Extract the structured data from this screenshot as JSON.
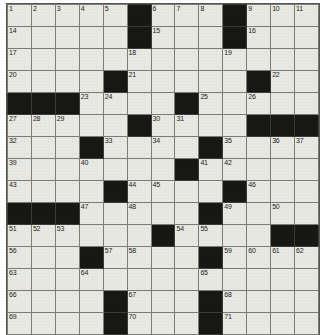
{
  "document": {
    "type": "crossword-puzzle-grid",
    "title": "Crossword Puzzle",
    "columns": 13,
    "rows": 15,
    "colors": {
      "cell_background": "#e9e9e4",
      "block_background": "#161614",
      "grid_line": "#7c7c74",
      "number_text": "#1a1a18",
      "page_background": "#ffffff"
    }
  },
  "grid": {
    "cells": [
      [
        {
          "block": false,
          "number": "1"
        },
        {
          "block": false,
          "number": "2"
        },
        {
          "block": false,
          "number": "3"
        },
        {
          "block": false,
          "number": "4"
        },
        {
          "block": false,
          "number": "5"
        },
        {
          "block": true,
          "number": ""
        },
        {
          "block": false,
          "number": "6"
        },
        {
          "block": false,
          "number": "7"
        },
        {
          "block": false,
          "number": "8"
        },
        {
          "block": true,
          "number": ""
        },
        {
          "block": false,
          "number": "9"
        },
        {
          "block": false,
          "number": "10"
        },
        {
          "block": false,
          "number": "11"
        },
        {
          "block": false,
          "number": "12"
        },
        {
          "block": false,
          "number": "13"
        }
      ],
      [
        {
          "block": false,
          "number": "14"
        },
        {
          "block": false,
          "number": ""
        },
        {
          "block": false,
          "number": ""
        },
        {
          "block": false,
          "number": ""
        },
        {
          "block": false,
          "number": ""
        },
        {
          "block": true,
          "number": ""
        },
        {
          "block": false,
          "number": "15"
        },
        {
          "block": false,
          "number": ""
        },
        {
          "block": false,
          "number": ""
        },
        {
          "block": true,
          "number": ""
        },
        {
          "block": false,
          "number": "16"
        },
        {
          "block": false,
          "number": ""
        },
        {
          "block": false,
          "number": ""
        },
        {
          "block": false,
          "number": ""
        },
        {
          "block": false,
          "number": ""
        }
      ],
      [
        {
          "block": false,
          "number": "17"
        },
        {
          "block": false,
          "number": ""
        },
        {
          "block": false,
          "number": ""
        },
        {
          "block": false,
          "number": ""
        },
        {
          "block": false,
          "number": ""
        },
        {
          "block": false,
          "number": "18"
        },
        {
          "block": false,
          "number": ""
        },
        {
          "block": false,
          "number": ""
        },
        {
          "block": false,
          "number": ""
        },
        {
          "block": false,
          "number": "19"
        },
        {
          "block": false,
          "number": ""
        },
        {
          "block": false,
          "number": ""
        },
        {
          "block": false,
          "number": ""
        },
        {
          "block": false,
          "number": ""
        },
        {
          "block": false,
          "number": ""
        }
      ],
      [
        {
          "block": false,
          "number": "20"
        },
        {
          "block": false,
          "number": ""
        },
        {
          "block": false,
          "number": ""
        },
        {
          "block": false,
          "number": ""
        },
        {
          "block": true,
          "number": ""
        },
        {
          "block": false,
          "number": "21"
        },
        {
          "block": false,
          "number": ""
        },
        {
          "block": false,
          "number": ""
        },
        {
          "block": false,
          "number": ""
        },
        {
          "block": false,
          "number": ""
        },
        {
          "block": true,
          "number": ""
        },
        {
          "block": false,
          "number": "22"
        },
        {
          "block": false,
          "number": ""
        },
        {
          "block": false,
          "number": ""
        },
        {
          "block": false,
          "number": ""
        }
      ],
      [
        {
          "block": true,
          "number": ""
        },
        {
          "block": true,
          "number": ""
        },
        {
          "block": true,
          "number": ""
        },
        {
          "block": false,
          "number": "23"
        },
        {
          "block": false,
          "number": "24"
        },
        {
          "block": false,
          "number": ""
        },
        {
          "block": false,
          "number": ""
        },
        {
          "block": true,
          "number": ""
        },
        {
          "block": false,
          "number": "25"
        },
        {
          "block": false,
          "number": ""
        },
        {
          "block": false,
          "number": "26"
        },
        {
          "block": false,
          "number": ""
        },
        {
          "block": false,
          "number": ""
        },
        {
          "block": false,
          "number": ""
        },
        {
          "block": false,
          "number": ""
        }
      ],
      [
        {
          "block": false,
          "number": "27"
        },
        {
          "block": false,
          "number": "28"
        },
        {
          "block": false,
          "number": "29"
        },
        {
          "block": false,
          "number": ""
        },
        {
          "block": false,
          "number": ""
        },
        {
          "block": true,
          "number": ""
        },
        {
          "block": false,
          "number": "30"
        },
        {
          "block": false,
          "number": "31"
        },
        {
          "block": false,
          "number": ""
        },
        {
          "block": false,
          "number": ""
        },
        {
          "block": true,
          "number": ""
        },
        {
          "block": true,
          "number": ""
        },
        {
          "block": true,
          "number": ""
        },
        {
          "block": true,
          "number": ""
        },
        {
          "block": true,
          "number": ""
        }
      ],
      [
        {
          "block": false,
          "number": "32"
        },
        {
          "block": false,
          "number": ""
        },
        {
          "block": false,
          "number": ""
        },
        {
          "block": true,
          "number": ""
        },
        {
          "block": false,
          "number": "33"
        },
        {
          "block": false,
          "number": ""
        },
        {
          "block": false,
          "number": "34"
        },
        {
          "block": false,
          "number": ""
        },
        {
          "block": true,
          "number": ""
        },
        {
          "block": false,
          "number": "35"
        },
        {
          "block": false,
          "number": ""
        },
        {
          "block": false,
          "number": "36"
        },
        {
          "block": false,
          "number": "37"
        },
        {
          "block": false,
          "number": "38"
        },
        {
          "block": false,
          "number": ""
        }
      ],
      [
        {
          "block": false,
          "number": "39"
        },
        {
          "block": false,
          "number": ""
        },
        {
          "block": false,
          "number": ""
        },
        {
          "block": false,
          "number": "40"
        },
        {
          "block": false,
          "number": ""
        },
        {
          "block": false,
          "number": ""
        },
        {
          "block": false,
          "number": ""
        },
        {
          "block": true,
          "number": ""
        },
        {
          "block": false,
          "number": "41"
        },
        {
          "block": false,
          "number": "42"
        },
        {
          "block": false,
          "number": ""
        },
        {
          "block": false,
          "number": ""
        },
        {
          "block": false,
          "number": ""
        },
        {
          "block": false,
          "number": ""
        },
        {
          "block": false,
          "number": ""
        }
      ],
      [
        {
          "block": false,
          "number": "43"
        },
        {
          "block": false,
          "number": ""
        },
        {
          "block": false,
          "number": ""
        },
        {
          "block": false,
          "number": ""
        },
        {
          "block": true,
          "number": ""
        },
        {
          "block": false,
          "number": "44"
        },
        {
          "block": false,
          "number": "45"
        },
        {
          "block": false,
          "number": ""
        },
        {
          "block": false,
          "number": ""
        },
        {
          "block": true,
          "number": ""
        },
        {
          "block": false,
          "number": "46"
        },
        {
          "block": false,
          "number": ""
        },
        {
          "block": false,
          "number": ""
        },
        {
          "block": false,
          "number": ""
        },
        {
          "block": false,
          "number": ""
        }
      ],
      [
        {
          "block": true,
          "number": ""
        },
        {
          "block": true,
          "number": ""
        },
        {
          "block": true,
          "number": ""
        },
        {
          "block": false,
          "number": "47"
        },
        {
          "block": false,
          "number": ""
        },
        {
          "block": false,
          "number": "48"
        },
        {
          "block": false,
          "number": ""
        },
        {
          "block": false,
          "number": ""
        },
        {
          "block": true,
          "number": ""
        },
        {
          "block": false,
          "number": "49"
        },
        {
          "block": false,
          "number": ""
        },
        {
          "block": false,
          "number": "50"
        },
        {
          "block": false,
          "number": ""
        },
        {
          "block": false,
          "number": ""
        },
        {
          "block": false,
          "number": ""
        }
      ],
      [
        {
          "block": false,
          "number": "51"
        },
        {
          "block": false,
          "number": "52"
        },
        {
          "block": false,
          "number": "53"
        },
        {
          "block": false,
          "number": ""
        },
        {
          "block": false,
          "number": ""
        },
        {
          "block": false,
          "number": ""
        },
        {
          "block": true,
          "number": ""
        },
        {
          "block": false,
          "number": "54"
        },
        {
          "block": false,
          "number": "55"
        },
        {
          "block": false,
          "number": ""
        },
        {
          "block": false,
          "number": ""
        },
        {
          "block": true,
          "number": ""
        },
        {
          "block": true,
          "number": ""
        },
        {
          "block": true,
          "number": ""
        },
        {
          "block": true,
          "number": ""
        }
      ],
      [
        {
          "block": false,
          "number": "56"
        },
        {
          "block": false,
          "number": ""
        },
        {
          "block": false,
          "number": ""
        },
        {
          "block": true,
          "number": ""
        },
        {
          "block": false,
          "number": "57"
        },
        {
          "block": false,
          "number": "58"
        },
        {
          "block": false,
          "number": ""
        },
        {
          "block": false,
          "number": ""
        },
        {
          "block": true,
          "number": ""
        },
        {
          "block": false,
          "number": "59"
        },
        {
          "block": false,
          "number": "60"
        },
        {
          "block": false,
          "number": "61"
        },
        {
          "block": false,
          "number": "62"
        },
        {
          "block": false,
          "number": ""
        },
        {
          "block": false,
          "number": ""
        }
      ],
      [
        {
          "block": false,
          "number": "63"
        },
        {
          "block": false,
          "number": ""
        },
        {
          "block": false,
          "number": ""
        },
        {
          "block": false,
          "number": "64"
        },
        {
          "block": false,
          "number": ""
        },
        {
          "block": false,
          "number": ""
        },
        {
          "block": false,
          "number": ""
        },
        {
          "block": false,
          "number": ""
        },
        {
          "block": false,
          "number": "65"
        },
        {
          "block": false,
          "number": ""
        },
        {
          "block": false,
          "number": ""
        },
        {
          "block": false,
          "number": ""
        },
        {
          "block": false,
          "number": ""
        },
        {
          "block": false,
          "number": ""
        },
        {
          "block": false,
          "number": ""
        }
      ],
      [
        {
          "block": false,
          "number": "66"
        },
        {
          "block": false,
          "number": ""
        },
        {
          "block": false,
          "number": ""
        },
        {
          "block": false,
          "number": ""
        },
        {
          "block": true,
          "number": ""
        },
        {
          "block": false,
          "number": "67"
        },
        {
          "block": false,
          "number": ""
        },
        {
          "block": false,
          "number": ""
        },
        {
          "block": true,
          "number": ""
        },
        {
          "block": false,
          "number": "68"
        },
        {
          "block": false,
          "number": ""
        },
        {
          "block": false,
          "number": ""
        },
        {
          "block": false,
          "number": ""
        },
        {
          "block": false,
          "number": ""
        },
        {
          "block": false,
          "number": ""
        }
      ],
      [
        {
          "block": false,
          "number": "69"
        },
        {
          "block": false,
          "number": ""
        },
        {
          "block": false,
          "number": ""
        },
        {
          "block": false,
          "number": ""
        },
        {
          "block": true,
          "number": ""
        },
        {
          "block": false,
          "number": "70"
        },
        {
          "block": false,
          "number": ""
        },
        {
          "block": false,
          "number": ""
        },
        {
          "block": true,
          "number": ""
        },
        {
          "block": false,
          "number": "71"
        },
        {
          "block": false,
          "number": ""
        },
        {
          "block": false,
          "number": ""
        },
        {
          "block": false,
          "number": ""
        },
        {
          "block": false,
          "number": ""
        },
        {
          "block": false,
          "number": ""
        }
      ]
    ]
  }
}
